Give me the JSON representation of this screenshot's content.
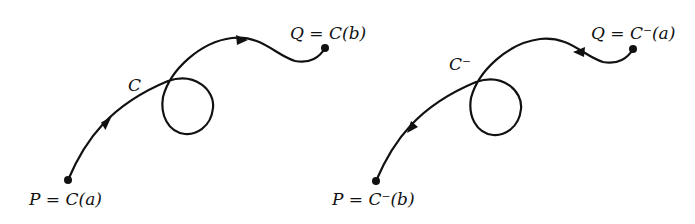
{
  "figures": [
    {
      "name": "curve-C",
      "curve_label": "C",
      "start_label": "P = C(a)",
      "end_label": "Q = C(b)",
      "direction": "forward (P to Q)"
    },
    {
      "name": "curve-C-minus",
      "curve_label": "C⁻",
      "start_label": "Q = C⁻(a)",
      "end_label": "P = C⁻(b)",
      "direction": "reverse (Q to P)"
    }
  ],
  "labels": {
    "left_curve": "C",
    "left_p": "P = C(a)",
    "left_q": "Q = C(b)",
    "right_curve": "C⁻",
    "right_p": "P = C⁻(b)",
    "right_q": "Q = C⁻(a)"
  }
}
